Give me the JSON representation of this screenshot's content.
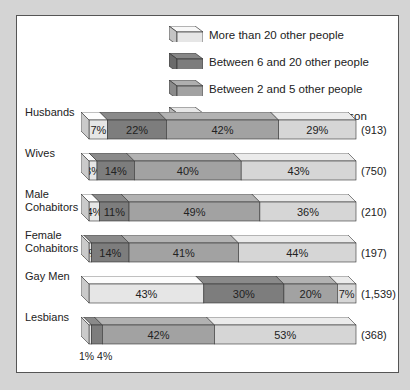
{
  "legend": [
    {
      "key": "more20",
      "label": "More than 20 other people",
      "color": "#e6e6e6"
    },
    {
      "key": "b6_20",
      "label": "Between 6 and 20 other people",
      "color": "#7d7d7d"
    },
    {
      "key": "b2_5",
      "label": "Between 2 and 5 other people",
      "color": "#a2a2a2"
    },
    {
      "key": "one",
      "label": "Sex with only one other person",
      "color": "#d6d6d6"
    }
  ],
  "rows": [
    {
      "label": "Husbands",
      "count": "(913)",
      "segments": [
        {
          "key": "more20",
          "v": 7,
          "t": "7%"
        },
        {
          "key": "b6_20",
          "v": 22,
          "t": "22%"
        },
        {
          "key": "b2_5",
          "v": 42,
          "t": "42%"
        },
        {
          "key": "one",
          "v": 29,
          "t": "29%"
        }
      ]
    },
    {
      "label": "Wives",
      "count": "(750)",
      "segments": [
        {
          "key": "more20",
          "v": 3,
          "t": "3%"
        },
        {
          "key": "b6_20",
          "v": 14,
          "t": "14%"
        },
        {
          "key": "b2_5",
          "v": 40,
          "t": "40%"
        },
        {
          "key": "one",
          "v": 43,
          "t": "43%"
        }
      ]
    },
    {
      "label": "Male\nCohabitors",
      "count": "(210)",
      "segments": [
        {
          "key": "more20",
          "v": 4,
          "t": "4%"
        },
        {
          "key": "b6_20",
          "v": 11,
          "t": "11%"
        },
        {
          "key": "b2_5",
          "v": 49,
          "t": "49%"
        },
        {
          "key": "one",
          "v": 36,
          "t": "36%"
        }
      ]
    },
    {
      "label": "Female\nCohabitors",
      "count": "(197)",
      "segments": [
        {
          "key": "more20",
          "v": 1,
          "t": "1%"
        },
        {
          "key": "b6_20",
          "v": 14,
          "t": "14%"
        },
        {
          "key": "b2_5",
          "v": 41,
          "t": "41%"
        },
        {
          "key": "one",
          "v": 44,
          "t": "44%"
        }
      ]
    },
    {
      "label": "Gay Men",
      "count": "(1,539)",
      "segments": [
        {
          "key": "more20",
          "v": 43,
          "t": "43%"
        },
        {
          "key": "b6_20",
          "v": 30,
          "t": "30%"
        },
        {
          "key": "b2_5",
          "v": 20,
          "t": "20%"
        },
        {
          "key": "one",
          "v": 7,
          "t": "7%"
        }
      ]
    },
    {
      "label": "Lesbians",
      "count": "(368)",
      "segments": [
        {
          "key": "more20",
          "v": 1,
          "t": ""
        },
        {
          "key": "b6_20",
          "v": 4,
          "t": ""
        },
        {
          "key": "b2_5",
          "v": 42,
          "t": "42%"
        },
        {
          "key": "one",
          "v": 53,
          "t": "53%"
        }
      ],
      "callouts": [
        "1%",
        "4%"
      ]
    }
  ],
  "chart_data": {
    "type": "bar",
    "orientation": "horizontal",
    "stacked": true,
    "percent": true,
    "title": "",
    "categories": [
      "Husbands",
      "Wives",
      "Male Cohabitors",
      "Female Cohabitors",
      "Gay Men",
      "Lesbians"
    ],
    "sample_sizes": [
      "(913)",
      "(750)",
      "(210)",
      "(197)",
      "(1,539)",
      "(368)"
    ],
    "series": [
      {
        "name": "More than 20 other people",
        "values": [
          7,
          3,
          4,
          1,
          43,
          1
        ]
      },
      {
        "name": "Between 6 and 20 other people",
        "values": [
          22,
          14,
          11,
          14,
          30,
          4
        ]
      },
      {
        "name": "Between 2 and 5 other people",
        "values": [
          42,
          40,
          49,
          41,
          20,
          42
        ]
      },
      {
        "name": "Sex with only one other person",
        "values": [
          29,
          43,
          36,
          44,
          7,
          53
        ]
      }
    ],
    "legend_position": "top-right",
    "grid": false,
    "note": "Gay Men bar segment order reversed visually (43%, 30%, 20%, 7%)"
  }
}
